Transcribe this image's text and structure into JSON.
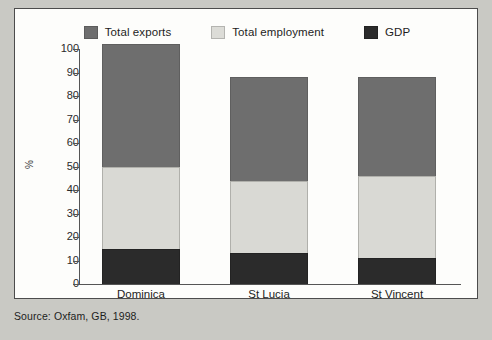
{
  "figure": {
    "caption": "Source: Oxfam, GB, 1998."
  },
  "legend": {
    "position": "top-center",
    "items": [
      {
        "label": "Total exports",
        "color": "#6e6e6e",
        "key": "total_exports"
      },
      {
        "label": "Total employment",
        "color": "#d9d9d4",
        "key": "total_employment"
      },
      {
        "label": "GDP",
        "color": "#2b2b2b",
        "key": "gdp"
      }
    ]
  },
  "chart_data": {
    "type": "bar",
    "stacked": true,
    "title": "",
    "subtitle": "",
    "xlabel": "",
    "ylabel": "%",
    "ylim": [
      0,
      100
    ],
    "yticks": [
      0,
      10,
      20,
      30,
      40,
      50,
      60,
      70,
      80,
      90,
      100
    ],
    "ytick_labels": [
      "0",
      "10",
      "20",
      "30",
      "40",
      "50",
      "60",
      "70",
      "80",
      "90",
      "100"
    ],
    "grid": false,
    "categories": [
      "Dominica",
      "St Lucia",
      "St Vincent"
    ],
    "series": [
      {
        "name": "GDP",
        "color": "#2b2b2b",
        "values": [
          15,
          13,
          11
        ]
      },
      {
        "name": "Total employment",
        "color": "#d9d9d4",
        "values": [
          35,
          31,
          35
        ]
      },
      {
        "name": "Total exports",
        "color": "#6e6e6e",
        "values": [
          52,
          44,
          42
        ]
      }
    ],
    "cumulative_tops": [
      {
        "category": "Dominica",
        "gdp": 15,
        "employment_top": 50,
        "exports_top": 102
      },
      {
        "category": "St Lucia",
        "gdp": 13,
        "employment_top": 44,
        "exports_top": 88
      },
      {
        "category": "St Vincent",
        "gdp": 11,
        "employment_top": 46,
        "exports_top": 88
      }
    ]
  },
  "axis": {
    "y_title": "%"
  }
}
